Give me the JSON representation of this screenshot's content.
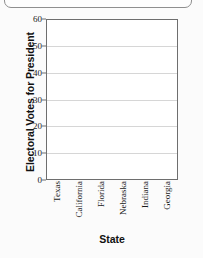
{
  "chart_data": {
    "type": "bar",
    "title": "",
    "xlabel": "State",
    "ylabel": "Electoral Votes for President",
    "categories": [
      "Texas",
      "California",
      "Florida",
      "Nebraska",
      "Indiana",
      "Georgia"
    ],
    "values": [
      null,
      null,
      null,
      null,
      null,
      null
    ],
    "series": [
      {
        "name": "Electoral Votes for President",
        "values": [
          null,
          null,
          null,
          null,
          null,
          null
        ]
      }
    ],
    "ylim": [
      0,
      60
    ],
    "yticks": [
      0,
      10,
      20,
      30,
      40,
      50,
      60
    ],
    "ytick_labels": [
      "0",
      "10",
      "20",
      "30",
      "40",
      "50",
      "60"
    ],
    "grid": true,
    "grid_axis": "y",
    "legend": false,
    "colors": {
      "axis": "#6e6e6e",
      "gridline": "#d6d6d6",
      "plot_background": "#ffffff",
      "figure_background": "#fbfbfb",
      "text": "#111111"
    }
  }
}
